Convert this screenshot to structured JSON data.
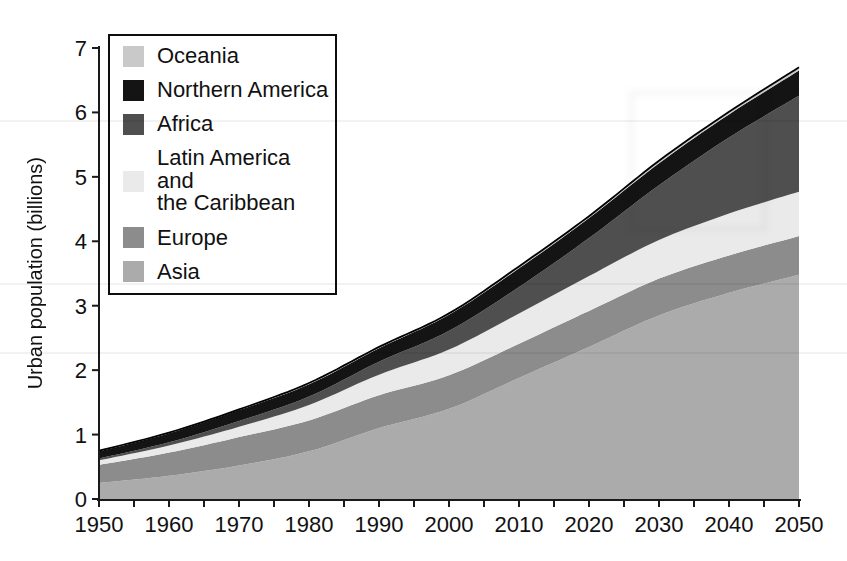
{
  "figure": {
    "ylabel": "Urban population (billions)",
    "x_tick_labels": [
      "1950",
      "1960",
      "1970",
      "1980",
      "1990",
      "2000",
      "2010",
      "2020",
      "2030",
      "2040",
      "2050"
    ],
    "y_tick_labels": [
      "0",
      "1",
      "2",
      "3",
      "4",
      "5",
      "6",
      "7"
    ]
  },
  "legend": {
    "items": [
      {
        "id": "oceania",
        "label": "Oceania",
        "color": "#c9c9c9"
      },
      {
        "id": "northern-america",
        "label": "Northern America",
        "color": "#141414"
      },
      {
        "id": "africa",
        "label": "Africa",
        "color": "#4f4f4f"
      },
      {
        "id": "latin-america",
        "label": "Latin America and\nthe Caribbean",
        "color": "#eaeaea"
      },
      {
        "id": "europe",
        "label": "Europe",
        "color": "#8c8c8c"
      },
      {
        "id": "asia",
        "label": "Asia",
        "color": "#ababab"
      }
    ]
  },
  "chart_data": {
    "type": "area",
    "stacked": true,
    "stack_order": "bottom-to-top",
    "title": "",
    "xlabel": "",
    "ylabel": "Urban population (billions)",
    "unit": "billions",
    "xlim": [
      1950,
      2050
    ],
    "ylim": [
      0,
      7
    ],
    "grid": false,
    "legend_position": "upper-left",
    "x": [
      1950,
      1960,
      1970,
      1980,
      1990,
      2000,
      2010,
      2020,
      2030,
      2040,
      2050
    ],
    "x_minor_tick_step_years": 5,
    "series": [
      {
        "name": "Asia",
        "color": "#ababab",
        "values": [
          0.25,
          0.36,
          0.52,
          0.74,
          1.1,
          1.4,
          1.88,
          2.36,
          2.85,
          3.2,
          3.48
        ]
      },
      {
        "name": "Europe",
        "color": "#8c8c8c",
        "values": [
          0.28,
          0.36,
          0.44,
          0.48,
          0.51,
          0.52,
          0.53,
          0.56,
          0.57,
          0.58,
          0.6
        ]
      },
      {
        "name": "Latin America and the Caribbean",
        "color": "#eaeaea",
        "values": [
          0.07,
          0.11,
          0.16,
          0.24,
          0.32,
          0.4,
          0.47,
          0.54,
          0.6,
          0.65,
          0.69
        ]
      },
      {
        "name": "Africa",
        "color": "#4f4f4f",
        "values": [
          0.03,
          0.05,
          0.09,
          0.13,
          0.2,
          0.29,
          0.41,
          0.59,
          0.85,
          1.18,
          1.49
        ]
      },
      {
        "name": "Northern America",
        "color": "#141414",
        "values": [
          0.11,
          0.14,
          0.17,
          0.19,
          0.21,
          0.25,
          0.29,
          0.31,
          0.34,
          0.36,
          0.39
        ]
      },
      {
        "name": "Oceania",
        "color": "#c9c9c9",
        "values": [
          0.01,
          0.01,
          0.01,
          0.02,
          0.02,
          0.02,
          0.03,
          0.03,
          0.04,
          0.04,
          0.05
        ]
      }
    ]
  }
}
